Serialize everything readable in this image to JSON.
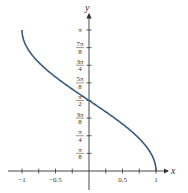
{
  "chart_data": {
    "type": "line",
    "title": "",
    "function": "y = arccos(x)",
    "xlabel": "x",
    "ylabel": "y",
    "xlim": [
      -1.1,
      1.2
    ],
    "ylim": [
      0,
      3.4
    ],
    "x_ticks": [
      -1,
      -0.75,
      -0.5,
      -0.25,
      0,
      0.25,
      0.5,
      0.75,
      1
    ],
    "x_tick_labels": [
      {
        "value": -1,
        "label": "−1"
      },
      {
        "value": -0.5,
        "label": "−0.5"
      },
      {
        "value": 0.5,
        "label": "0.5"
      },
      {
        "value": 1,
        "label": "1"
      }
    ],
    "y_tick_labels": [
      {
        "value": 0.3927,
        "num": "π",
        "den": "8"
      },
      {
        "value": 0.7854,
        "num": "π",
        "den": "4"
      },
      {
        "value": 1.1781,
        "num": "3π",
        "den": "8"
      },
      {
        "value": 1.5708,
        "num": "π",
        "den": "2"
      },
      {
        "value": 1.9635,
        "num": "5π",
        "den": "8"
      },
      {
        "value": 2.3562,
        "num": "3π",
        "den": "4"
      },
      {
        "value": 2.7489,
        "num": "7π",
        "den": "8"
      },
      {
        "value": 3.1416,
        "num": "π",
        "den": ""
      }
    ],
    "series": [
      {
        "name": "arccos(x)",
        "x": [
          -1,
          -0.9,
          -0.75,
          -0.5,
          -0.25,
          0,
          0.25,
          0.5,
          0.75,
          0.9,
          1
        ],
        "y": [
          3.1416,
          2.6906,
          2.4189,
          2.0944,
          1.8235,
          1.5708,
          1.3181,
          1.0472,
          0.7227,
          0.451,
          0
        ]
      }
    ],
    "grid": false,
    "legend": null,
    "colors": {
      "curve": "#3a5a80",
      "axis": "#333333"
    }
  }
}
